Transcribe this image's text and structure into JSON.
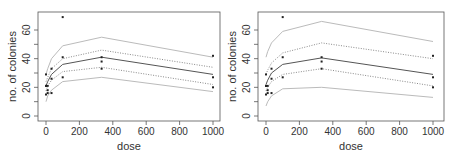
{
  "chart_data": [
    {
      "type": "line",
      "title": "",
      "xlabel": "dose",
      "ylabel": "no. of colonies",
      "xlim": [
        0,
        1000
      ],
      "ylim": [
        0,
        70
      ],
      "xticks": [
        0,
        200,
        400,
        600,
        800,
        1000
      ],
      "yticks": [
        0,
        20,
        40,
        60
      ],
      "grid": false,
      "legend": null,
      "x": [
        0,
        10,
        33,
        100,
        333,
        1000
      ],
      "series": [
        {
          "name": "outer upper band",
          "style": "solid-light",
          "values": [
            29,
            33,
            40,
            49,
            55,
            41
          ]
        },
        {
          "name": "inner upper band",
          "style": "dotted",
          "values": [
            24,
            27,
            33,
            40,
            46,
            34
          ]
        },
        {
          "name": "fitted mean",
          "style": "solid-dark",
          "values": [
            21,
            24,
            29,
            36,
            41,
            29
          ]
        },
        {
          "name": "inner lower band",
          "style": "dotted",
          "values": [
            17.5,
            21,
            25,
            31,
            34,
            22
          ]
        },
        {
          "name": "outer lower band",
          "style": "solid-light",
          "values": [
            10,
            14,
            18,
            24,
            27,
            17
          ]
        }
      ],
      "points": [
        {
          "x": 0,
          "y": 29
        },
        {
          "x": 0,
          "y": 21
        },
        {
          "x": 0,
          "y": 21
        },
        {
          "x": 0,
          "y": 15
        },
        {
          "x": 10,
          "y": 21
        },
        {
          "x": 10,
          "y": 18
        },
        {
          "x": 10,
          "y": 16
        },
        {
          "x": 33,
          "y": 33
        },
        {
          "x": 33,
          "y": 26
        },
        {
          "x": 33,
          "y": 16
        },
        {
          "x": 100,
          "y": 69
        },
        {
          "x": 100,
          "y": 41
        },
        {
          "x": 100,
          "y": 27
        },
        {
          "x": 333,
          "y": 41
        },
        {
          "x": 333,
          "y": 38
        },
        {
          "x": 333,
          "y": 33
        },
        {
          "x": 1000,
          "y": 42
        },
        {
          "x": 1000,
          "y": 27
        },
        {
          "x": 1000,
          "y": 20
        }
      ]
    },
    {
      "type": "line",
      "title": "",
      "xlabel": "dose",
      "ylabel": "no. of colonies",
      "xlim": [
        0,
        1000
      ],
      "ylim": [
        0,
        70
      ],
      "xticks": [
        0,
        200,
        400,
        600,
        800,
        1000
      ],
      "yticks": [
        0,
        20,
        40,
        60
      ],
      "grid": false,
      "legend": null,
      "x": [
        0,
        10,
        33,
        100,
        333,
        1000
      ],
      "series": [
        {
          "name": "outer upper band",
          "style": "solid-light",
          "values": [
            41,
            45,
            51,
            59,
            66,
            52
          ]
        },
        {
          "name": "inner upper band",
          "style": "dotted",
          "values": [
            29,
            32,
            37,
            44,
            51,
            40
          ]
        },
        {
          "name": "fitted mean",
          "style": "solid-dark",
          "values": [
            22,
            25,
            30,
            36,
            40.5,
            29
          ]
        },
        {
          "name": "inner lower band",
          "style": "dotted",
          "values": [
            17.5,
            20,
            24,
            29,
            33,
            21
          ]
        },
        {
          "name": "outer lower band",
          "style": "solid-light",
          "values": [
            7,
            10,
            14,
            19,
            20,
            13
          ]
        }
      ],
      "points": [
        {
          "x": 0,
          "y": 29
        },
        {
          "x": 0,
          "y": 21
        },
        {
          "x": 0,
          "y": 21
        },
        {
          "x": 0,
          "y": 15
        },
        {
          "x": 10,
          "y": 21
        },
        {
          "x": 10,
          "y": 18
        },
        {
          "x": 10,
          "y": 16
        },
        {
          "x": 33,
          "y": 33
        },
        {
          "x": 33,
          "y": 26
        },
        {
          "x": 33,
          "y": 16
        },
        {
          "x": 100,
          "y": 69
        },
        {
          "x": 100,
          "y": 41
        },
        {
          "x": 100,
          "y": 27
        },
        {
          "x": 333,
          "y": 41
        },
        {
          "x": 333,
          "y": 38
        },
        {
          "x": 333,
          "y": 33
        },
        {
          "x": 1000,
          "y": 42
        },
        {
          "x": 1000,
          "y": 27
        },
        {
          "x": 1000,
          "y": 20
        }
      ]
    }
  ],
  "colors": {
    "axis": "#555555",
    "text": "#333333",
    "solid_light": "#bbbbbb",
    "dotted": "#8a8a8a",
    "solid_dark": "#555555",
    "point": "#222222"
  },
  "panels": [
    {
      "xlabel": "dose",
      "ylabel": "no. of colonies",
      "xtick_labels": [
        "0",
        "200",
        "400",
        "600",
        "800",
        "1000"
      ],
      "ytick_labels": [
        "0",
        "20",
        "40",
        "60"
      ]
    },
    {
      "xlabel": "dose",
      "ylabel": "no. of colonies",
      "xtick_labels": [
        "0",
        "200",
        "400",
        "600",
        "800",
        "1000"
      ],
      "ytick_labels": [
        "0",
        "20",
        "40",
        "60"
      ]
    }
  ]
}
